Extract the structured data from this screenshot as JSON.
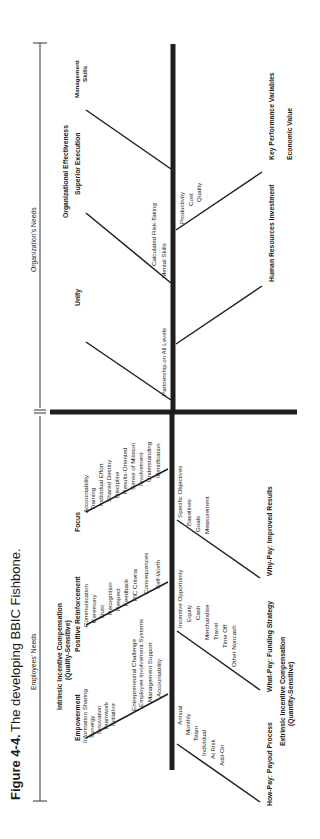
{
  "figure": {
    "label": "Figure 4-4.",
    "title": "The developing BBIC Fishbone."
  },
  "sections": {
    "employees_needs": "Employees' Needs",
    "organizations_needs": "Organization's Needs"
  },
  "employees": {
    "intrinsic_header": [
      "Intrinsic Incentive Compensation",
      "(Quality-Sensitive)"
    ],
    "extrinsic_header": [
      "Extrinsic Incentive Compensation",
      "(Quantity-Sensitive)"
    ],
    "upper_bones": [
      {
        "title": "Empowerment",
        "items": [
          "Information Sharing",
          "Synergy",
          "Innovation",
          "Teamwork",
          "Initiative",
          "Entrepreneurial Challenge",
          "Employee Involvement Systems",
          "Management Support",
          "Accountability"
        ]
      },
      {
        "title": "Positive Reinforcement",
        "items": [
          "Communication",
          "Ceremony",
          "Trust",
          "Recognition",
          "Respect",
          "Feedback",
          "PIC Criteria",
          "Consequences",
          "Self-Worth"
        ]
      },
      {
        "title": "Focus",
        "items": [
          "Accountability",
          "Training",
          "Individual Effort",
          "Shared Destiny",
          "Discipline",
          "Results-Oriented",
          "Sense of Mission",
          "Involvement",
          "Understanding",
          "Identification"
        ]
      }
    ],
    "lower_bones": [
      {
        "title": "How-Pay: Payout Process",
        "items": [
          "Annual",
          "Monthly",
          "Team",
          "Individual",
          "At Risk",
          "Add-On"
        ]
      },
      {
        "title": "What-Pay: Funding Strategy",
        "items": [
          "Incentive Opportunity",
          "Equity",
          "Cash",
          "Merchandise",
          "Travel",
          "Time Off",
          "Other Noncash"
        ]
      },
      {
        "title": "Why-Pay: Improved Results",
        "items": [
          "Specific Objectives",
          "Baselines",
          "Goals",
          "Measurement"
        ]
      }
    ]
  },
  "organization": {
    "header_left": "Organizational Effectiveness",
    "header_right": "Economic Value",
    "upper_bones": [
      {
        "title": "Unity",
        "items": [
          "Partnership on All Levels"
        ]
      },
      {
        "title": "Superior Execution",
        "items": [
          "Calculated Risk-Taking",
          "Mental Skills"
        ]
      },
      {
        "title": "Management Skills",
        "title_lines": [
          "Management",
          "Skills"
        ],
        "items": []
      }
    ],
    "lower_bones": [
      {
        "title": "Human Resources Investment",
        "items": []
      },
      {
        "title": "Key Performance Variables",
        "items": [
          "Productivity",
          "Cost",
          "Quality"
        ]
      }
    ]
  }
}
